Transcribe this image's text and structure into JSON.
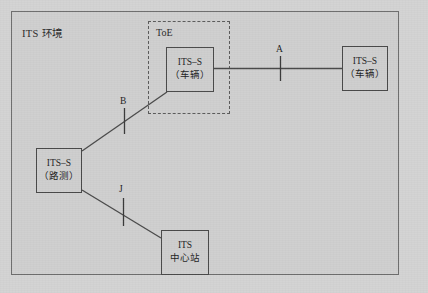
{
  "diagram": {
    "environment_label": "ITS 环境",
    "toe_label": "ToE",
    "nodes": {
      "toe_vehicle": {
        "line1": "ITS–S",
        "line2": "（车辆）"
      },
      "vehicle": {
        "line1": "ITS–S",
        "line2": "（车辆）"
      },
      "roadside": {
        "line1": "ITS–S",
        "line2": "（路测）"
      },
      "center": {
        "line1": "ITS",
        "line2": "中心站"
      }
    },
    "interfaces": {
      "a": "A",
      "b": "B",
      "j": "J"
    },
    "colors": {
      "background": "#d4d4d4",
      "frame_border": "#6e6e6e",
      "node_border": "#4a4a4a",
      "node_fill": "#cfcfcf",
      "link": "#4a4a4a",
      "text": "#1f1f1f"
    }
  }
}
